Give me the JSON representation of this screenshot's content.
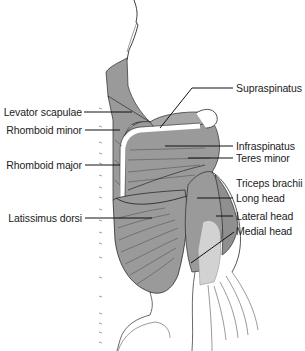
{
  "diagram": {
    "colors": {
      "muscle_fill": "#9a9a9a",
      "muscle_dark": "#7d7d7d",
      "medial_head_fill": "#d2d2d2",
      "outline": "#2a2a2a",
      "leader_line": "#111111",
      "background": "#ffffff"
    },
    "labels_left": [
      {
        "id": "levator-scapulae",
        "text": "Levator scapulae"
      },
      {
        "id": "rhomboid-minor",
        "text": "Rhomboid minor"
      },
      {
        "id": "rhomboid-major",
        "text": "Rhomboid major"
      },
      {
        "id": "latissimus-dorsi",
        "text": "Latissimus dorsi"
      }
    ],
    "labels_right": [
      {
        "id": "supraspinatus",
        "text": "Supraspinatus"
      },
      {
        "id": "infraspinatus",
        "text": "Infraspinatus"
      },
      {
        "id": "teres-minor",
        "text": "Teres minor"
      },
      {
        "id": "triceps-brachii",
        "text": "Triceps brachii"
      },
      {
        "id": "long-head",
        "text": "Long head"
      },
      {
        "id": "lateral-head",
        "text": "Lateral head"
      },
      {
        "id": "medial-head",
        "text": "Medial head"
      }
    ]
  }
}
